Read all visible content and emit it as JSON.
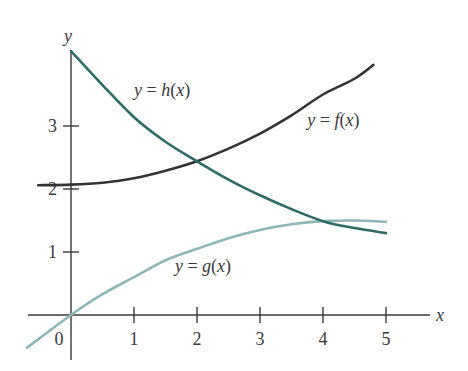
{
  "chart_data": {
    "type": "line",
    "title": "",
    "xlabel": "x",
    "ylabel": "y",
    "xlim": [
      -0.7,
      5.8
    ],
    "ylim": [
      -0.7,
      4.3
    ],
    "grid": false,
    "legend": "inline curve labels",
    "x_ticks": [
      "0",
      "1",
      "2",
      "3",
      "4",
      "5"
    ],
    "y_ticks": [
      "1",
      "2",
      "3"
    ],
    "series": [
      {
        "name": "y = f(x)",
        "color": "#333333",
        "label_pos": [
          3.75,
          3.0
        ],
        "points": [
          [
            -0.52,
            2.06
          ],
          [
            0,
            2.07
          ],
          [
            0.5,
            2.1
          ],
          [
            1,
            2.17
          ],
          [
            1.5,
            2.29
          ],
          [
            2,
            2.44
          ],
          [
            2.5,
            2.64
          ],
          [
            3,
            2.88
          ],
          [
            3.5,
            3.17
          ],
          [
            4,
            3.5
          ],
          [
            4.5,
            3.75
          ],
          [
            4.8,
            3.97
          ]
        ]
      },
      {
        "name": "y = g(x)",
        "color": "#8db7b6",
        "label_pos": [
          1.65,
          0.68
        ],
        "points": [
          [
            -0.7,
            -0.52
          ],
          [
            0,
            0
          ],
          [
            0.5,
            0.33
          ],
          [
            1,
            0.6
          ],
          [
            1.5,
            0.87
          ],
          [
            2,
            1.05
          ],
          [
            2.5,
            1.22
          ],
          [
            3,
            1.35
          ],
          [
            3.5,
            1.44
          ],
          [
            4,
            1.49
          ],
          [
            4.5,
            1.5
          ],
          [
            5,
            1.48
          ]
        ]
      },
      {
        "name": "y = h(x)",
        "color": "#2e6b66",
        "label_pos": [
          1.0,
          3.48
        ],
        "points": [
          [
            0,
            4.19
          ],
          [
            0.5,
            3.65
          ],
          [
            1,
            3.14
          ],
          [
            1.5,
            2.75
          ],
          [
            2,
            2.44
          ],
          [
            2.5,
            2.15
          ],
          [
            3,
            1.9
          ],
          [
            3.5,
            1.68
          ],
          [
            4,
            1.49
          ],
          [
            4.5,
            1.38
          ],
          [
            5,
            1.3
          ]
        ]
      }
    ]
  },
  "labels": {
    "x_axis": "x",
    "y_axis": "y",
    "origin": "0",
    "f": "y = f(x)",
    "g": "y = g(x)",
    "h": "y = h(x)"
  }
}
